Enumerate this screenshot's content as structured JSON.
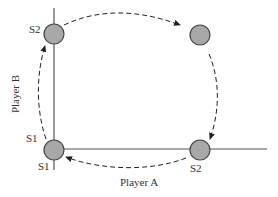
{
  "diagram": {
    "axes": {
      "x_label": "Player A",
      "y_label": "Player B"
    },
    "nodes": [
      {
        "id": "top-left",
        "strategy_label": "S2",
        "cx": 54,
        "cy": 34
      },
      {
        "id": "top-right",
        "strategy_label": "",
        "cx": 200,
        "cy": 35
      },
      {
        "id": "bottom-left",
        "strategy_label_a": "S1",
        "strategy_label_b": "S1",
        "cx": 54,
        "cy": 150
      },
      {
        "id": "bottom-right",
        "strategy_label": "S2",
        "cx": 200,
        "cy": 150
      }
    ],
    "labels": {
      "top_left_s2": "S2",
      "bottom_left_s1_b": "S1",
      "bottom_left_s1_a": "S1",
      "bottom_right_s2": "S2"
    },
    "arrows": [
      {
        "from": "bottom-left",
        "to": "top-left",
        "style": "dashed"
      },
      {
        "from": "top-left",
        "to": "top-right",
        "style": "dashed"
      },
      {
        "from": "top-right",
        "to": "bottom-right",
        "style": "dashed"
      },
      {
        "from": "bottom-right",
        "to": "bottom-left",
        "style": "dashed"
      }
    ],
    "colors": {
      "node_fill": "#a8a8a8",
      "node_stroke": "#444444",
      "line": "#555555",
      "arrow": "#222222"
    }
  }
}
